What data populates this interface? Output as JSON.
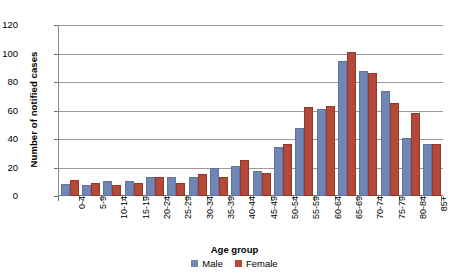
{
  "chart_data": {
    "type": "bar",
    "title": "",
    "xlabel": "Age group",
    "ylabel": "Number of notified cases",
    "ylim": [
      0,
      120
    ],
    "ytick_step": 20,
    "yticks": [
      0,
      20,
      40,
      60,
      80,
      100,
      120
    ],
    "grid": true,
    "legend_position": "bottom",
    "categories": [
      "0-4",
      "5-9",
      "10-14",
      "15-19",
      "20-24",
      "25-29",
      "30-34",
      "35-39",
      "40-44",
      "45-49",
      "50-54",
      "55-59",
      "60-64",
      "65-69",
      "70-74",
      "75-79",
      "80-84",
      "85+"
    ],
    "series": [
      {
        "name": "Male",
        "color": "#7087b6",
        "values": [
          7,
          6,
          9,
          9,
          12,
          12,
          12,
          18,
          20,
          16,
          33,
          46,
          60,
          93,
          86,
          72,
          39,
          35
        ]
      },
      {
        "name": "Female",
        "color": "#b4493a",
        "values": [
          10,
          8,
          6,
          8,
          12,
          8,
          14,
          12,
          24,
          15,
          35,
          61,
          62,
          100,
          85,
          64,
          57,
          35
        ]
      }
    ]
  }
}
